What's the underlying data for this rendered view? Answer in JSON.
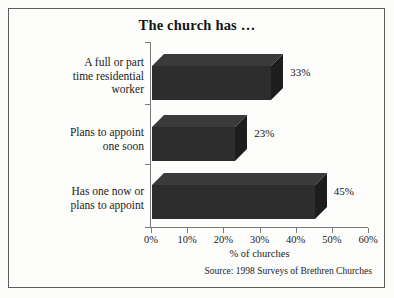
{
  "frame": {
    "border_color": "#5b5b5b",
    "background": "#fdfdfb"
  },
  "title": "The church has …",
  "source_note": "Source: 1998 Surveys of Brethren Churches",
  "axis": {
    "value_axis_title": "% of churches",
    "tick_labels": [
      "0%",
      "10%",
      "20%",
      "30%",
      "40%",
      "50%",
      "60%"
    ],
    "tick_values": [
      0,
      10,
      20,
      30,
      40,
      50,
      60
    ]
  },
  "bars": [
    {
      "label_lines": [
        "A full or part",
        "time residential",
        "worker"
      ],
      "label": "A full or part time residential worker",
      "value": 33,
      "value_label": "33%"
    },
    {
      "label_lines": [
        "Plans to appoint",
        "one soon"
      ],
      "label": "Plans to appoint one soon",
      "value": 23,
      "value_label": "23%"
    },
    {
      "label_lines": [
        "Has one now or",
        "plans to appoint"
      ],
      "label": "Has one now or plans to appoint",
      "value": 45,
      "value_label": "45%"
    }
  ],
  "colors": {
    "bar_front": "#2d2d2d",
    "bar_top": "#3a3a3a",
    "bar_side": "#1d1d1d",
    "axis_line": "#7a7a7a",
    "text": "#1b1b1b"
  },
  "chart_data": {
    "type": "bar",
    "orientation": "horizontal",
    "three_d": true,
    "title": "The church has …",
    "subtitle": "",
    "categories": [
      "A full or part time residential worker",
      "Plans to appoint one soon",
      "Has one now or plans to appoint"
    ],
    "values": [
      33,
      23,
      45
    ],
    "data_labels": [
      "33%",
      "23%",
      "45%"
    ],
    "xlabel": "% of churches",
    "ylabel": "",
    "xlim": [
      0,
      60
    ],
    "xticks": [
      0,
      10,
      20,
      30,
      40,
      50,
      60
    ],
    "xtick_labels": [
      "0%",
      "10%",
      "20%",
      "30%",
      "40%",
      "50%",
      "60%"
    ],
    "grid": false,
    "legend": false,
    "legend_position": "none",
    "annotations": [
      "Source: 1998 Surveys of Brethren Churches"
    ],
    "units": "percent"
  }
}
